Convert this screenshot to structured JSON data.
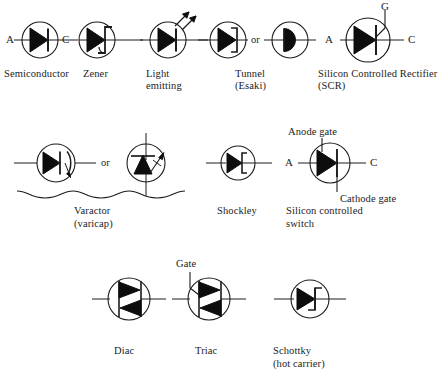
{
  "diagram": {
    "background": "#ffffff",
    "ink": "#1c1c1c"
  },
  "rows": [
    {
      "name": "row-1",
      "symbols": [
        {
          "id": "semiconductor-diode",
          "label": "Semiconductor",
          "label_lines": [
            "Semiconductor"
          ],
          "terminals": [
            {
              "name": "anode",
              "text": "A"
            },
            {
              "name": "cathode",
              "text": "C"
            }
          ]
        },
        {
          "id": "zener-diode",
          "label": "Zener",
          "label_lines": [
            "Zener"
          ],
          "terminals": []
        },
        {
          "id": "light-emitting-diode",
          "label": "Light emitting",
          "label_lines": [
            "Light",
            "emitting"
          ],
          "terminals": []
        },
        {
          "id": "tunnel-diode",
          "label": "Tunnel (Esaki)",
          "label_lines": [
            "Tunnel",
            "(Esaki)"
          ],
          "connector": "or",
          "terminals": []
        },
        {
          "id": "silicon-controlled-rectifier",
          "label": "Silicon Controlled Rectifier (SCR)",
          "label_lines": [
            "Silicon Controlled Rectifier",
            "(SCR)"
          ],
          "terminals": [
            {
              "name": "anode",
              "text": "A"
            },
            {
              "name": "cathode",
              "text": "C"
            },
            {
              "name": "gate",
              "text": "G"
            }
          ]
        }
      ]
    },
    {
      "name": "row-2",
      "symbols": [
        {
          "id": "varactor",
          "label": "Varactor (varicap)",
          "label_lines": [
            "Varactor",
            "(varicap)"
          ],
          "connector": "or",
          "terminals": []
        },
        {
          "id": "shockley-diode",
          "label": "Shockley",
          "label_lines": [
            "Shockley"
          ],
          "terminals": []
        },
        {
          "id": "silicon-controlled-switch",
          "label": "Silicon controlled switch",
          "label_lines": [
            "Silicon controlled",
            "switch"
          ],
          "terminals": [
            {
              "name": "anode",
              "text": "A"
            },
            {
              "name": "cathode",
              "text": "C"
            },
            {
              "name": "anode-gate",
              "text": "Anode gate"
            },
            {
              "name": "cathode-gate",
              "text": "Cathode gate"
            }
          ]
        }
      ]
    },
    {
      "name": "row-3",
      "symbols": [
        {
          "id": "diac",
          "label": "Diac",
          "label_lines": [
            "Diac"
          ],
          "terminals": []
        },
        {
          "id": "triac",
          "label": "Triac",
          "label_lines": [
            "Triac"
          ],
          "terminals": [
            {
              "name": "gate",
              "text": "Gate"
            }
          ]
        },
        {
          "id": "schottky-diode",
          "label": "Schottky (hot carrier)",
          "label_lines": [
            "Schottky",
            "(hot carrier)"
          ],
          "terminals": []
        }
      ]
    }
  ],
  "labels": {
    "semiconductor": "Semiconductor",
    "zener": "Zener",
    "light": "Light",
    "emitting": "emitting",
    "tunnel": "Tunnel",
    "esaki": "(Esaki)",
    "scr_line1": "Silicon Controlled Rectifier",
    "scr_line2": "(SCR)",
    "varactor": "Varactor",
    "varicap": "(varicap)",
    "shockley": "Shockley",
    "scs_line1": "Silicon controlled",
    "scs_line2": "switch",
    "diac": "Diac",
    "triac": "Triac",
    "schottky": "Schottky",
    "hotcarrier": "(hot carrier)",
    "or1": "or",
    "or2": "or",
    "anode_a1": "A",
    "cathode_c1": "C",
    "anode_a2": "A",
    "cathode_c2": "C",
    "gate_g": "G",
    "anode_a3": "A",
    "cathode_c3": "C",
    "anode_gate": "Anode gate",
    "cathode_gate": "Cathode gate",
    "gate_triac": "Gate"
  }
}
